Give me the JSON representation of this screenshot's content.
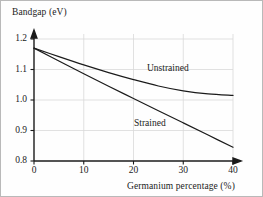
{
  "figure": {
    "background_color": "#fefefe",
    "border_color": "#b9b9b9",
    "ink_color": "#1b1b1b",
    "grid_color": "#d9d9d9"
  },
  "axes": {
    "ylabel": "Bandgap (eV)",
    "xlabel": "Germanium percentage (%)",
    "yticks": [
      "1.2",
      "1.1",
      "1.0",
      "0.9",
      "0.8"
    ],
    "xticks": [
      "0",
      "10",
      "20",
      "30",
      "40"
    ]
  },
  "labels": {
    "unstrained": "Unstrained",
    "strained": "Strained"
  },
  "chart_data": {
    "type": "line",
    "title": "",
    "xlabel": "Germanium percentage (%)",
    "ylabel": "Bandgap (eV)",
    "xlim": [
      0,
      40
    ],
    "ylim": [
      0.8,
      1.2
    ],
    "xticks": [
      0,
      10,
      20,
      30,
      40
    ],
    "yticks": [
      0.8,
      0.9,
      1.0,
      1.1,
      1.2
    ],
    "grid": true,
    "legend": "inline-annotations",
    "series": [
      {
        "name": "Unstrained",
        "x": [
          0,
          5,
          10,
          15,
          20,
          25,
          30,
          35,
          40
        ],
        "values": [
          1.17,
          1.142,
          1.115,
          1.09,
          1.067,
          1.046,
          1.03,
          1.02,
          1.015
        ]
      },
      {
        "name": "Strained",
        "x": [
          0,
          5,
          10,
          15,
          20,
          25,
          30,
          35,
          40
        ],
        "values": [
          1.17,
          1.128,
          1.086,
          1.045,
          1.005,
          0.965,
          0.925,
          0.885,
          0.845
        ]
      }
    ]
  }
}
